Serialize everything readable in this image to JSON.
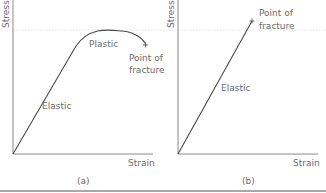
{
  "panels": [
    {
      "id": "a",
      "caption": "(a)",
      "y_axis_label": "Stress",
      "x_axis_label": "Strain",
      "regions": [
        "Elastic",
        "Plastic"
      ],
      "endpoint_label_line1": "Point of",
      "endpoint_label_line2": "fracture"
    },
    {
      "id": "b",
      "caption": "(b)",
      "y_axis_label": "Stress",
      "x_axis_label": "Strain",
      "regions": [
        "Elastic"
      ],
      "endpoint_label_line1": "Point of",
      "endpoint_label_line2": "fracture"
    }
  ],
  "colors": {
    "axis": "#8a8a8a",
    "curve": "#4a4a4a",
    "guide": "#d0d0d0",
    "text": "#6a6a6a",
    "border": "#9a9a9a"
  }
}
